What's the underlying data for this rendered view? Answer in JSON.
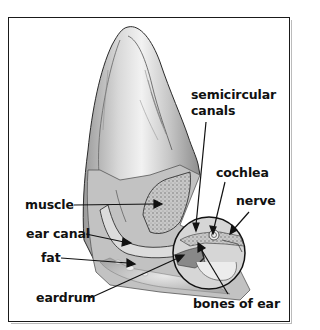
{
  "diagram": {
    "labels": {
      "semicircular_canals_line1": "semicircular",
      "semicircular_canals_line2": "canals",
      "cochlea": "cochlea",
      "nerve": "nerve",
      "muscle": "muscle",
      "ear_canal": "ear canal",
      "fat": "fat",
      "eardrum": "eardrum",
      "bones_of_ear": "bones of ear"
    },
    "colors": {
      "border": "#1a1a1a",
      "text": "#111111",
      "ear_fill": "#d4d4d4",
      "shading": "#8a8a8a"
    }
  }
}
